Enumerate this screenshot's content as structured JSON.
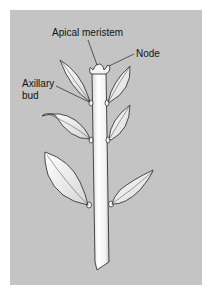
{
  "figure": {
    "background": "#c4c4c4",
    "labels": {
      "apical_meristem": "Apical meristem",
      "node": "Node",
      "axillary_bud_line1": "Axillary",
      "axillary_bud_line2": "bud"
    }
  }
}
